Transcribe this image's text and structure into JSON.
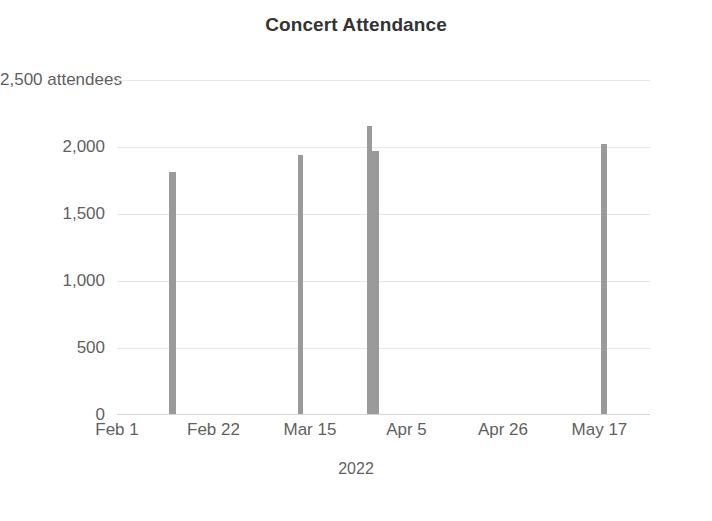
{
  "chart_data": {
    "type": "bar",
    "title": "Concert Attendance",
    "xlabel": "2022",
    "ylabel": "attendees",
    "ylim": [
      0,
      2500
    ],
    "grid": true,
    "legend": "none",
    "y_ticks": [
      {
        "value": 0,
        "label": "0"
      },
      {
        "value": 500,
        "label": "500"
      },
      {
        "value": 1000,
        "label": "1,000"
      },
      {
        "value": 1500,
        "label": "1,500"
      },
      {
        "value": 2000,
        "label": "2,000"
      },
      {
        "value": 2500,
        "label": "2,500 attendees"
      }
    ],
    "x_ticks": [
      {
        "label": "Feb 1",
        "day": 0
      },
      {
        "label": "Feb 22",
        "day": 21
      },
      {
        "label": "Mar 15",
        "day": 42
      },
      {
        "label": "Apr 5",
        "day": 63
      },
      {
        "label": "Apr 26",
        "day": 84
      },
      {
        "label": "May 17",
        "day": 105
      }
    ],
    "x_axis_start_day": 0,
    "x_axis_end_day": 116,
    "bar_color": "#9a9a9a",
    "categories": [
      "Feb 13",
      "Mar 11",
      "Mar 26",
      "Mar 27",
      "May 20"
    ],
    "values": [
      1813,
      1940,
      2160,
      1970,
      2020
    ],
    "points": [
      {
        "label": "Feb 13",
        "day": 12,
        "value": 1813,
        "width_px": 7
      },
      {
        "label": "Mar 11",
        "day": 40,
        "value": 1940,
        "width_px": 5
      },
      {
        "label": "Mar 26",
        "day": 55,
        "value": 2160,
        "width_px": 5
      },
      {
        "label": "Mar 27",
        "day": 56,
        "value": 1970,
        "width_px": 9
      },
      {
        "label": "May 20",
        "day": 106,
        "value": 2020,
        "width_px": 6
      }
    ]
  }
}
